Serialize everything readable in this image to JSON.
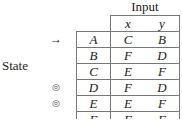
{
  "header": {
    "input_label": "Input",
    "state_label": "State"
  },
  "columns": [
    "",
    "x",
    "y"
  ],
  "rows": [
    {
      "state": "A",
      "x": "C",
      "y": "B",
      "marker": "arrow"
    },
    {
      "state": "B",
      "x": "F",
      "y": "D",
      "marker": ""
    },
    {
      "state": "C",
      "x": "E",
      "y": "F",
      "marker": ""
    },
    {
      "state": "D",
      "x": "F",
      "y": "D",
      "marker": "final"
    },
    {
      "state": "E",
      "x": "E",
      "y": "F",
      "marker": "final"
    },
    {
      "state": "F",
      "x": "F",
      "y": "F",
      "marker": ""
    }
  ],
  "icons": {
    "start": "→",
    "final": "◎"
  }
}
